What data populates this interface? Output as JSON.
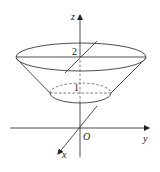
{
  "figure": {
    "axes": {
      "x_label": "x",
      "y_label": "y",
      "z_label": "z",
      "origin_label": "O"
    },
    "levels": {
      "top_label": "2",
      "bottom_label": "1"
    },
    "colors": {
      "line": "#3a3a3a",
      "background": "#ffffff"
    }
  }
}
